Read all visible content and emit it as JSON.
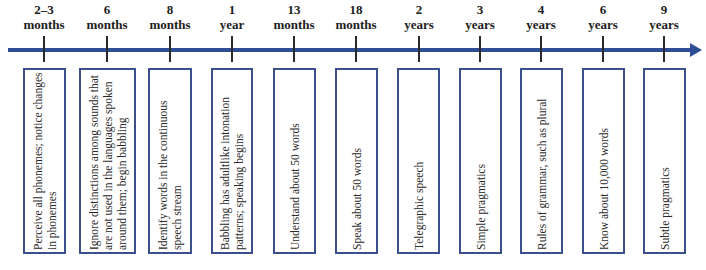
{
  "diagram": {
    "title": "",
    "colors": {
      "axis": "#2f4e96",
      "box_border": "#3b4f8c",
      "text": "#2a2a2a"
    },
    "milestones": [
      {
        "age_value": "2–3",
        "age_unit": "months",
        "description": "Perceive all phonemes; notice changes in phonemes"
      },
      {
        "age_value": "6",
        "age_unit": "months",
        "description": "Ignore distinctions among sounds that are not used in the languages spoken around them; begin babbling"
      },
      {
        "age_value": "8",
        "age_unit": "months",
        "description": "Identify words in the continuous speech stream"
      },
      {
        "age_value": "1",
        "age_unit": "year",
        "description": "Babbling has adultlike intonation patterns; speaking begins"
      },
      {
        "age_value": "13",
        "age_unit": "months",
        "description": "Understand about 50 words"
      },
      {
        "age_value": "18",
        "age_unit": "months",
        "description": "Speak about 50 words"
      },
      {
        "age_value": "2",
        "age_unit": "years",
        "description": "Telegraphic speech"
      },
      {
        "age_value": "3",
        "age_unit": "years",
        "description": "Simple pragmatics"
      },
      {
        "age_value": "4",
        "age_unit": "years",
        "description": "Rules of grammar, such as plural"
      },
      {
        "age_value": "6",
        "age_unit": "years",
        "description": "Know about 10,000 words"
      },
      {
        "age_value": "9",
        "age_unit": "years",
        "description": "Subtle pragmatics"
      }
    ]
  }
}
